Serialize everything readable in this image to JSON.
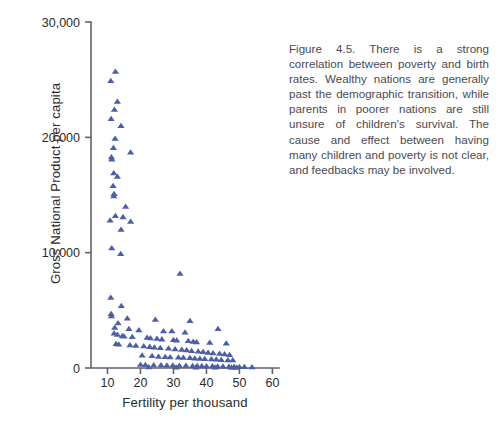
{
  "figure": {
    "caption": "Figure 4.5. There is a strong correlation between poverty and birth rates. Wealthy nations are generally past the demographic transition, while parents in poorer nations are still unsure of children's survival. The cause and effect between having many children and poverty is not clear, and feedbacks may be involved."
  },
  "chart_data": {
    "type": "scatter",
    "title": "",
    "xlabel": "Fertility per thousand",
    "ylabel": "Gross National Product per capita",
    "xlim": [
      5,
      62
    ],
    "ylim": [
      0,
      30000
    ],
    "xticks": [
      10,
      20,
      30,
      40,
      50,
      60
    ],
    "xticklabels": [
      "10",
      "20",
      "30",
      "40",
      "50",
      "60"
    ],
    "yticks": [
      0,
      10000,
      20000,
      30000
    ],
    "yticklabels": [
      "0",
      "10,000",
      "20,000",
      "30,000"
    ],
    "grid": false,
    "legend": null,
    "marker": "triangle",
    "marker_color": "#4c5fa4",
    "marker_size": 6,
    "series": [
      {
        "name": "Nations",
        "points": [
          [
            12.4,
            25700
          ],
          [
            11.0,
            24900
          ],
          [
            13.0,
            23100
          ],
          [
            12.1,
            22400
          ],
          [
            11.1,
            21600
          ],
          [
            14.1,
            21000
          ],
          [
            12.3,
            19900
          ],
          [
            11.8,
            19100
          ],
          [
            17.0,
            18700
          ],
          [
            11.2,
            18300
          ],
          [
            11.3,
            18100
          ],
          [
            11.9,
            16900
          ],
          [
            13.0,
            16600
          ],
          [
            11.7,
            15800
          ],
          [
            12.0,
            15100
          ],
          [
            11.9,
            14900
          ],
          [
            15.5,
            14000
          ],
          [
            12.4,
            13200
          ],
          [
            14.7,
            13100
          ],
          [
            10.8,
            12800
          ],
          [
            17.0,
            12700
          ],
          [
            14.1,
            12000
          ],
          [
            11.3,
            10400
          ],
          [
            14.0,
            9900
          ],
          [
            32.0,
            8200
          ],
          [
            11.0,
            6100
          ],
          [
            14.2,
            5400
          ],
          [
            11.1,
            4700
          ],
          [
            11.2,
            4500
          ],
          [
            16.0,
            4300
          ],
          [
            24.5,
            4200
          ],
          [
            35.0,
            4100
          ],
          [
            13.2,
            3900
          ],
          [
            12.2,
            3500
          ],
          [
            16.5,
            3400
          ],
          [
            19.5,
            3300
          ],
          [
            27.0,
            3200
          ],
          [
            29.5,
            3200
          ],
          [
            33.5,
            3100
          ],
          [
            43.5,
            3400
          ],
          [
            12.0,
            3000
          ],
          [
            13.0,
            2900
          ],
          [
            14.5,
            2800
          ],
          [
            15.0,
            2750
          ],
          [
            17.5,
            2700
          ],
          [
            22.0,
            2650
          ],
          [
            23.0,
            2600
          ],
          [
            25.0,
            2550
          ],
          [
            26.5,
            2500
          ],
          [
            30.0,
            2450
          ],
          [
            31.0,
            2400
          ],
          [
            34.5,
            2350
          ],
          [
            36.0,
            2300
          ],
          [
            37.0,
            2250
          ],
          [
            41.0,
            2200
          ],
          [
            46.0,
            2150
          ],
          [
            12.6,
            2100
          ],
          [
            13.4,
            2050
          ],
          [
            16.8,
            2000
          ],
          [
            18.6,
            1950
          ],
          [
            21.0,
            1900
          ],
          [
            22.8,
            1850
          ],
          [
            24.2,
            1800
          ],
          [
            26.0,
            1750
          ],
          [
            28.5,
            1700
          ],
          [
            30.5,
            1650
          ],
          [
            32.5,
            1600
          ],
          [
            34.0,
            1550
          ],
          [
            35.5,
            1500
          ],
          [
            37.5,
            1450
          ],
          [
            39.0,
            1400
          ],
          [
            40.5,
            1350
          ],
          [
            42.0,
            1300
          ],
          [
            44.0,
            1250
          ],
          [
            45.5,
            1200
          ],
          [
            47.0,
            1150
          ],
          [
            20.5,
            1100
          ],
          [
            23.5,
            1050
          ],
          [
            25.5,
            1000
          ],
          [
            27.5,
            980
          ],
          [
            29.0,
            950
          ],
          [
            31.5,
            920
          ],
          [
            33.0,
            900
          ],
          [
            35.0,
            880
          ],
          [
            36.5,
            850
          ],
          [
            38.0,
            820
          ],
          [
            39.5,
            800
          ],
          [
            41.5,
            780
          ],
          [
            43.0,
            750
          ],
          [
            44.5,
            720
          ],
          [
            46.5,
            700
          ],
          [
            48.0,
            680
          ],
          [
            20.0,
            300
          ],
          [
            21.5,
            280
          ],
          [
            24.0,
            260
          ],
          [
            26.2,
            250
          ],
          [
            28.0,
            240
          ],
          [
            29.8,
            230
          ],
          [
            31.8,
            220
          ],
          [
            33.8,
            210
          ],
          [
            35.8,
            200
          ],
          [
            37.2,
            190
          ],
          [
            38.6,
            180
          ],
          [
            40.0,
            170
          ],
          [
            41.8,
            160
          ],
          [
            43.4,
            150
          ],
          [
            45.0,
            140
          ],
          [
            46.8,
            130
          ],
          [
            48.4,
            120
          ],
          [
            50.0,
            110
          ],
          [
            51.5,
            100
          ],
          [
            53.8,
            90
          ],
          [
            22.5,
            80
          ],
          [
            30.8,
            70
          ],
          [
            36.8,
            60
          ],
          [
            42.6,
            55
          ],
          [
            47.6,
            50
          ],
          [
            49.2,
            45
          ]
        ]
      }
    ]
  }
}
